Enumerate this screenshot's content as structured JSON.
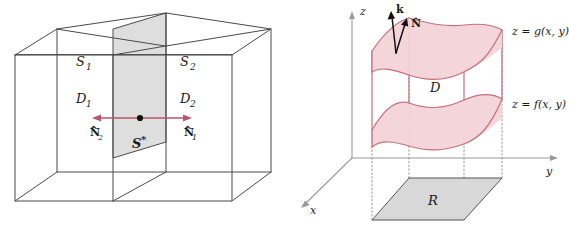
{
  "figure": {
    "panels": [
      {
        "id": "left",
        "caption": "Box split by interior surface S*"
      },
      {
        "id": "right",
        "caption": "Solid D between z = f(x,y) and z = g(x,y) over region R"
      }
    ]
  },
  "left_panel": {
    "labels": {
      "surface_1": "S",
      "surface_1_sub": "1",
      "surface_2": "S",
      "surface_2_sub": "2",
      "region_1": "D",
      "region_1_sub": "1",
      "region_2": "D",
      "region_2_sub": "2",
      "interior_surface": "S",
      "interior_surface_sup": "*",
      "normal_left": "N",
      "normal_left_sub": "2",
      "normal_left_hat": "^",
      "normal_right": "N",
      "normal_right_sub": "1",
      "normal_right_hat": "^"
    },
    "colors": {
      "edge": "#4a4a4a",
      "shaded_plane": "#dedede",
      "normal_arrow": "#b8566a",
      "point": "#111111"
    }
  },
  "right_panel": {
    "axes": {
      "x_label": "x",
      "y_label": "y",
      "z_label": "z"
    },
    "labels": {
      "upper_surface": "z = g(x, y)",
      "lower_surface": "z = f(x, y)",
      "solid_region": "D",
      "base_region": "R",
      "k_vector": "k",
      "normal_vector": "N",
      "normal_vector_hat": "^"
    },
    "colors": {
      "surface_stroke": "#c4707f",
      "surface_fill": "#f2d3d8",
      "axis": "#9a9a9a",
      "base_fill": "#d8d8d8",
      "base_stroke": "#555555",
      "vector": "#111111"
    }
  }
}
